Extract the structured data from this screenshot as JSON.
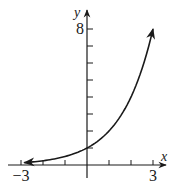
{
  "chart_data": {
    "type": "line",
    "title": "",
    "xlabel": "x",
    "ylabel": "y",
    "function": "y = 2^x",
    "xlim": [
      -3,
      3
    ],
    "ylim": [
      0,
      8
    ],
    "x_ticks": [
      -3,
      -2,
      -1,
      1,
      2,
      3
    ],
    "y_ticks": [
      1,
      2,
      3,
      4,
      5,
      6,
      7,
      8
    ],
    "x_tick_labels": [
      {
        "value": -3,
        "label": "−3"
      },
      {
        "value": 3,
        "label": "3"
      }
    ],
    "y_tick_labels": [
      {
        "value": 8,
        "label": "8"
      }
    ],
    "grid": false,
    "legend": null,
    "series": [
      {
        "name": "2^x",
        "x": [
          -2.85,
          -2,
          -1,
          0,
          1,
          2,
          2.6,
          3
        ],
        "values": [
          0.14,
          0.25,
          0.5,
          1,
          2,
          4,
          6.06,
          8
        ],
        "arrows": "both ends"
      }
    ],
    "color": "#1a1a1a"
  }
}
